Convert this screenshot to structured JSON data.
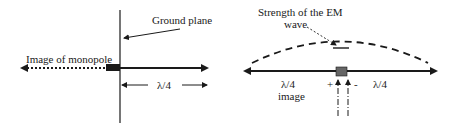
{
  "left_diagram": {
    "ground_plane_label": "Ground plane",
    "image_label": "Image of monopole",
    "length_label": "λ/4"
  },
  "right_diagram": {
    "strength_label_line1": "Strength of the EM",
    "strength_label_line2": "wave",
    "left_length_label": "λ/4",
    "left_image_label": "image",
    "right_length_label": "λ/4",
    "plus_sign": "+",
    "minus_sign": "-"
  },
  "colors": {
    "ink": "#1a1a1a",
    "feed_block_left": "#1a1a1a",
    "feed_block_right": "#666666"
  }
}
